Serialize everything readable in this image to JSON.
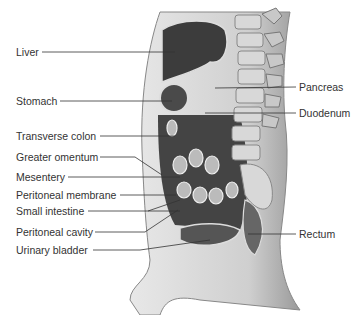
{
  "figure": {
    "labels_left": [
      {
        "text": "Liver",
        "x": 16,
        "y": 46
      },
      {
        "text": "Stomach",
        "x": 16,
        "y": 95
      },
      {
        "text": "Transverse colon",
        "x": 16,
        "y": 130
      },
      {
        "text": "Greater omentum",
        "x": 16,
        "y": 151
      },
      {
        "text": "Mesentery",
        "x": 16,
        "y": 172
      },
      {
        "text": "Peritoneal membrane",
        "x": 16,
        "y": 190
      },
      {
        "text": "Small intestine",
        "x": 16,
        "y": 205
      },
      {
        "text": "Peritoneal cavity",
        "x": 16,
        "y": 226
      },
      {
        "text": "Urinary bladder",
        "x": 16,
        "y": 245
      }
    ],
    "labels_right": [
      {
        "text": "Pancreas",
        "x": 299,
        "y": 81
      },
      {
        "text": "Duodenum",
        "x": 299,
        "y": 107
      },
      {
        "text": "Rectum",
        "x": 299,
        "y": 229
      }
    ]
  }
}
